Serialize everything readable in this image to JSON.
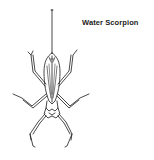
{
  "figure": {
    "label": "Water Scorpion",
    "line_color": "#1a1a1a",
    "background": "#ffffff"
  }
}
